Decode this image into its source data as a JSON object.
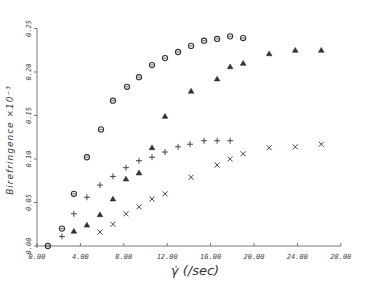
{
  "chart_data": {
    "type": "scatter",
    "title": "",
    "xlabel": "γ̇ (/sec)",
    "ylabel": "Birefringence ×10⁻³",
    "xlim": [
      0,
      28
    ],
    "ylim": [
      0,
      0.25
    ],
    "x_ticks": [
      "0.00",
      "4.00",
      "8.00",
      "12.00",
      "16.00",
      "20.00",
      "24.00",
      "28.00"
    ],
    "y_ticks": [
      "0.00",
      "0.05",
      "0.10",
      "0.15",
      "0.20",
      "0.25"
    ],
    "grid": false,
    "legend": null,
    "series": [
      {
        "name": "circles",
        "marker": "circle",
        "x": [
          1.0,
          2.3,
          3.4,
          4.6,
          5.9,
          7.0,
          8.3,
          9.4,
          10.6,
          11.8,
          13.0,
          14.2,
          15.4,
          16.6,
          17.8,
          19.0
        ],
        "y": [
          0.0,
          0.02,
          0.06,
          0.102,
          0.134,
          0.167,
          0.183,
          0.194,
          0.208,
          0.216,
          0.223,
          0.23,
          0.236,
          0.238,
          0.241,
          0.239
        ]
      },
      {
        "name": "plus",
        "marker": "plus",
        "x": [
          2.3,
          3.4,
          4.6,
          5.8,
          7.0,
          8.2,
          9.4,
          10.6,
          11.8,
          13.0,
          14.1,
          15.4,
          16.6,
          17.8
        ],
        "y": [
          0.011,
          0.037,
          0.056,
          0.07,
          0.08,
          0.09,
          0.098,
          0.102,
          0.108,
          0.114,
          0.117,
          0.121,
          0.121,
          0.121
        ]
      },
      {
        "name": "triangles",
        "marker": "triangle",
        "x": [
          3.4,
          4.6,
          5.8,
          7.0,
          8.2,
          9.4,
          10.6,
          11.8,
          14.2,
          16.6,
          17.8,
          19.0,
          21.4,
          23.8,
          26.2
        ],
        "y": [
          0.017,
          0.024,
          0.036,
          0.054,
          0.077,
          0.084,
          0.113,
          0.149,
          0.178,
          0.192,
          0.206,
          0.21,
          0.221,
          0.225,
          0.225
        ]
      },
      {
        "name": "crosses",
        "marker": "x",
        "x": [
          5.8,
          7.0,
          8.2,
          9.4,
          10.6,
          11.8,
          14.2,
          16.6,
          17.8,
          19.0,
          21.4,
          23.8,
          26.2
        ],
        "y": [
          0.016,
          0.025,
          0.037,
          0.045,
          0.054,
          0.06,
          0.079,
          0.093,
          0.1,
          0.106,
          0.113,
          0.114,
          0.117
        ]
      }
    ]
  },
  "colors": {
    "axis": "#555555",
    "marker": "#333333",
    "background": "#ffffff"
  }
}
